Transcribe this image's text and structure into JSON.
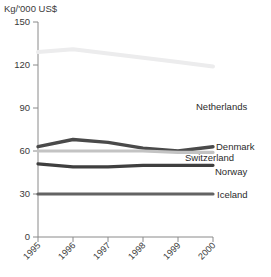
{
  "chart_data": {
    "type": "line",
    "title": "",
    "subtitle": "",
    "ylabel": "Kg/'000 US$",
    "xlabel": "",
    "x": [
      "1995",
      "1996",
      "1997",
      "1998",
      "1999",
      "2000"
    ],
    "categories": [
      "1995",
      "1996",
      "1997",
      "1998",
      "1999",
      "2000"
    ],
    "ylim": [
      0,
      150
    ],
    "yticks": [
      0,
      30,
      60,
      90,
      120,
      150
    ],
    "ytick_labels": [
      "0",
      "30",
      "60",
      "90",
      "120",
      "150"
    ],
    "grid": false,
    "legend_position": "right-inline-labels",
    "series": [
      {
        "name": "Netherlands",
        "color": "#ececed",
        "values": [
          129,
          131,
          128,
          125,
          122,
          119
        ]
      },
      {
        "name": "Denmark",
        "color": "#4a4a4a",
        "values": [
          63,
          68,
          66,
          62,
          60,
          63
        ]
      },
      {
        "name": "Switzerland",
        "color": "#c3c3c3",
        "values": [
          60,
          60,
          60,
          60,
          59,
          59
        ]
      },
      {
        "name": "Norway",
        "color": "#3f3f3f",
        "values": [
          51,
          49,
          49,
          50,
          50,
          50
        ]
      },
      {
        "name": "Iceland",
        "color": "#636363",
        "values": [
          30,
          30,
          30,
          30,
          30,
          30
        ]
      }
    ]
  },
  "axis": {
    "y_title": "Kg/'000 US$"
  },
  "series_labels": {
    "netherlands": "Netherlands",
    "denmark": "Denmark",
    "switzerland": "Switzerland",
    "norway": "Norway",
    "iceland": "Iceland"
  }
}
